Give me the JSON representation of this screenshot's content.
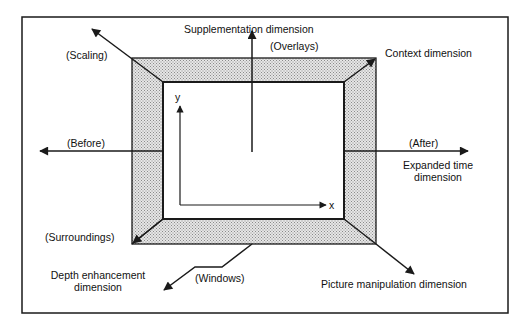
{
  "diagram": {
    "colors": {
      "frame": "#1a1a1a",
      "screen_border_fill": "#c8c8c8",
      "background": "#ffffff"
    },
    "axes": {
      "x_label": "x",
      "y_label": "y"
    },
    "labels": {
      "supplementation": "Supplementation dimension",
      "overlays": "(Overlays)",
      "context": "Context dimension",
      "scaling": "(Scaling)",
      "before": "(Before)",
      "after": "(After)",
      "expanded_time_line1": "Expanded time",
      "expanded_time_line2": "dimension",
      "surroundings": "(Surroundings)",
      "depth_line1": "Depth enhancement",
      "depth_line2": "dimension",
      "windows": "(Windows)",
      "picture_manipulation": "Picture manipulation dimension"
    }
  }
}
